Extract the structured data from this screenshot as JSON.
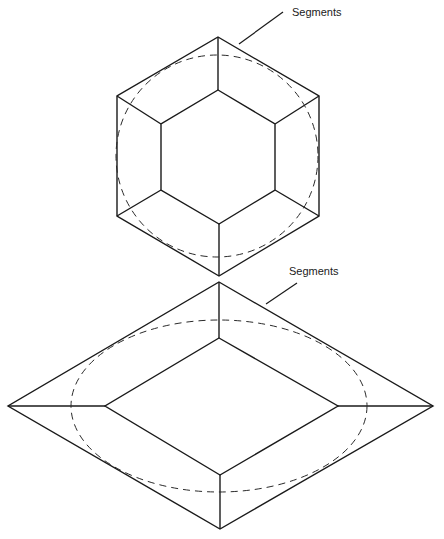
{
  "diagram": {
    "figures": [
      {
        "name": "hexagon",
        "label": "Segments",
        "label_pos": [
          292,
          16
        ],
        "leader": [
          [
            283,
            12
          ],
          [
            239,
            44
          ]
        ],
        "outer": [
          [
            218,
            37
          ],
          [
            319,
            96
          ],
          [
            319,
            216
          ],
          [
            219,
            276
          ],
          [
            117,
            216
          ],
          [
            117,
            96
          ]
        ],
        "inner": [
          [
            218,
            90
          ],
          [
            275,
            124
          ],
          [
            275,
            190
          ],
          [
            219,
            224
          ],
          [
            161,
            190
          ],
          [
            161,
            124
          ]
        ],
        "dashed_ellipse": {
          "cx": 217,
          "cy": 156,
          "rx": 101,
          "ry": 101
        }
      },
      {
        "name": "diamond",
        "label": "Segments",
        "label_pos": [
          289,
          275
        ],
        "leader": [
          [
            297,
            283
          ],
          [
            266,
            304
          ]
        ],
        "outer": [
          [
            219,
            282
          ],
          [
            433,
            406
          ],
          [
            220,
            529
          ],
          [
            8,
            406
          ]
        ],
        "inner": [
          [
            219,
            338
          ],
          [
            338,
            406
          ],
          [
            220,
            475
          ],
          [
            105,
            406
          ]
        ],
        "dashed_ellipse": {
          "cx": 219,
          "cy": 406,
          "rx": 148,
          "ry": 86
        }
      }
    ],
    "colors": {
      "line": "#1a1a1a",
      "background": "#ffffff"
    }
  }
}
